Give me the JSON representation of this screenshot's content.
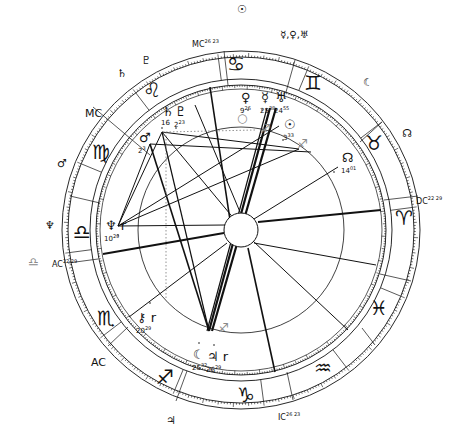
{
  "chart": {
    "center": [
      241,
      230
    ],
    "radii": {
      "outer_out": 179,
      "outer_in": 173,
      "zodiac_out": 151,
      "zodiac_in": 145,
      "house_ring": 141,
      "aspect": 103,
      "hub": 17
    },
    "asc_longitude": 202.5,
    "colors": {
      "ink": "#111111",
      "gray": "#9a9a9a",
      "background": "#ffffff"
    }
  },
  "zodiac_signs": [
    {
      "name": "aries",
      "glyph": "♈",
      "x": 404,
      "y": 218
    },
    {
      "name": "taurus",
      "glyph": "♉",
      "x": 374,
      "y": 143
    },
    {
      "name": "gemini",
      "glyph": "♊",
      "x": 313,
      "y": 83
    },
    {
      "name": "cancer",
      "glyph": "♋",
      "x": 236,
      "y": 64
    },
    {
      "name": "leo",
      "glyph": "♌",
      "x": 152,
      "y": 90
    },
    {
      "name": "virgo",
      "glyph": "♍",
      "x": 101,
      "y": 152
    },
    {
      "name": "libra",
      "glyph": "♎",
      "x": 82,
      "y": 232
    },
    {
      "name": "scorpio",
      "glyph": "♏",
      "x": 106,
      "y": 318
    },
    {
      "name": "sagittarius",
      "glyph": "♐",
      "x": 165,
      "y": 377
    },
    {
      "name": "capricorn",
      "glyph": "♑",
      "x": 246,
      "y": 395
    },
    {
      "name": "aquarius",
      "glyph": "♒",
      "x": 323,
      "y": 368
    },
    {
      "name": "pisces",
      "glyph": "♓",
      "x": 379,
      "y": 308
    }
  ],
  "axes": {
    "mc": {
      "label": "MC",
      "degree": "26",
      "minute": "23",
      "x": 192,
      "y": 39
    },
    "ic": {
      "label": "IC",
      "degree": "26",
      "minute": "23",
      "x": 278,
      "y": 412
    },
    "asc": {
      "label": "AC",
      "degree": "22",
      "minute": "29",
      "x": 52,
      "y": 259
    },
    "dsc": {
      "label": "DC",
      "degree": "22",
      "minute": "29",
      "x": 416,
      "y": 196
    }
  },
  "natal_planets": [
    {
      "name": "sun",
      "glyph": "☉",
      "degree": "3",
      "minute": "33",
      "x": 289,
      "y": 125,
      "dx": 283,
      "dy": 140
    },
    {
      "name": "moon",
      "glyph": "☾",
      "degree": "25",
      "minute": "32",
      "x": 198,
      "y": 355,
      "dx": 199,
      "dy": 343
    },
    {
      "name": "mercury",
      "glyph": "☿",
      "degree": "25",
      "minute": "38",
      "x": 266,
      "y": 98,
      "dx": 262,
      "dy": 110
    },
    {
      "name": "venus",
      "glyph": "♀",
      "degree": "9",
      "minute": "26",
      "x": 246,
      "y": 98,
      "dx": 248,
      "dy": 110
    },
    {
      "name": "mars",
      "glyph": "♂",
      "degree": "2",
      "minute": "3",
      "x": 144,
      "y": 138,
      "dx": 152,
      "dy": 150
    },
    {
      "name": "jupiter",
      "glyph": "♃ r",
      "degree": "26",
      "minute": "29",
      "x": 212,
      "y": 357,
      "dx": 214,
      "dy": 345
    },
    {
      "name": "saturn",
      "glyph": "♄",
      "degree": "16",
      "minute": "",
      "x": 167,
      "y": 112,
      "dx": 162,
      "dy": 128
    },
    {
      "name": "uranus",
      "glyph": "♅",
      "degree": "24",
      "minute": "55",
      "x": 280,
      "y": 98,
      "dx": 275,
      "dy": 110
    },
    {
      "name": "neptune",
      "glyph": "♆ r",
      "degree": "10",
      "minute": "29",
      "x": 110,
      "y": 226,
      "dx": 118,
      "dy": 235
    },
    {
      "name": "pluto",
      "glyph": "♇",
      "degree": "2",
      "minute": "23",
      "x": 180,
      "y": 112,
      "dx": 176,
      "dy": 128
    },
    {
      "name": "chiron",
      "glyph": "⚷ r",
      "degree": "20",
      "minute": "29",
      "x": 142,
      "y": 318,
      "dx": 150,
      "dy": 303
    },
    {
      "name": "north-node",
      "glyph": "☊",
      "degree": "14",
      "minute": "01",
      "x": 347,
      "y": 158,
      "dx": 334,
      "dy": 172
    }
  ],
  "transit_planets": [
    {
      "name": "sun",
      "glyph": "☉",
      "x": 237,
      "y": 4
    },
    {
      "name": "mercury-venus-uranus",
      "glyph": "☿,♀,♅",
      "x": 280,
      "y": 30
    },
    {
      "name": "moon",
      "glyph": "☾",
      "x": 363,
      "y": 77
    },
    {
      "name": "north-node",
      "glyph": "☊",
      "x": 402,
      "y": 128
    },
    {
      "name": "saturn",
      "glyph": "♄",
      "x": 117,
      "y": 68
    },
    {
      "name": "pluto",
      "glyph": "♇",
      "x": 141,
      "y": 55
    },
    {
      "name": "mc-marker",
      "glyph": "MC",
      "x": 85,
      "y": 108
    },
    {
      "name": "mars",
      "glyph": "♂",
      "x": 57,
      "y": 158
    },
    {
      "name": "neptune",
      "glyph": "♆",
      "x": 45,
      "y": 220
    },
    {
      "name": "ac-marker",
      "glyph": "AC",
      "x": 91,
      "y": 357
    },
    {
      "name": "jupiter",
      "glyph": "♃",
      "x": 166,
      "y": 415
    }
  ],
  "gray_marks": [
    {
      "name": "libra-gray",
      "glyph": "♎",
      "x": 28,
      "y": 256
    },
    {
      "name": "sagittarius-gray",
      "glyph": "♐",
      "x": 218,
      "y": 322
    },
    {
      "name": "sagittarius-gray-2",
      "glyph": "♐",
      "x": 260,
      "y": 123
    },
    {
      "name": "sagittarius-gray-3",
      "glyph": "♐",
      "x": 297,
      "y": 138
    },
    {
      "name": "circle-gray",
      "glyph": "○",
      "x": 237,
      "y": 112
    }
  ],
  "house_cusps": [
    {
      "x1": 150,
      "y1": 155,
      "x2": 93,
      "y2": 107
    },
    {
      "x1": 228,
      "y1": 85,
      "x2": 224,
      "y2": 51
    },
    {
      "x1": 286,
      "y1": 92,
      "x2": 295,
      "y2": 60
    },
    {
      "x1": 360,
      "y1": 142,
      "x2": 382,
      "y2": 122
    },
    {
      "x1": 384,
      "y1": 200,
      "x2": 418,
      "y2": 196
    },
    {
      "x1": 380,
      "y1": 274,
      "x2": 411,
      "y2": 281
    },
    {
      "x1": 362,
      "y1": 328,
      "x2": 375,
      "y2": 345
    },
    {
      "x1": 287,
      "y1": 372,
      "x2": 293,
      "y2": 400
    },
    {
      "x1": 187,
      "y1": 371,
      "x2": 176,
      "y2": 401
    },
    {
      "x1": 128,
      "y1": 327,
      "x2": 108,
      "y2": 346
    },
    {
      "x1": 98,
      "y1": 259,
      "x2": 68,
      "y2": 263
    },
    {
      "x1": 100,
      "y1": 203,
      "x2": 70,
      "y2": 196
    }
  ],
  "aspect_lines": [
    {
      "x1": 150,
      "y1": 144,
      "x2": 209,
      "y2": 331,
      "w": 1.6
    },
    {
      "x1": 162,
      "y1": 132,
      "x2": 209,
      "y2": 331,
      "w": 1.2
    },
    {
      "x1": 162,
      "y1": 132,
      "x2": 118,
      "y2": 226,
      "w": 1.0
    },
    {
      "x1": 162,
      "y1": 132,
      "x2": 299,
      "y2": 149,
      "w": 1.0
    },
    {
      "x1": 162,
      "y1": 132,
      "x2": 235,
      "y2": 220,
      "w": 1.0
    },
    {
      "x1": 118,
      "y1": 226,
      "x2": 299,
      "y2": 149,
      "w": 1.0
    },
    {
      "x1": 118,
      "y1": 226,
      "x2": 279,
      "y2": 126,
      "w": 1.0
    },
    {
      "x1": 118,
      "y1": 226,
      "x2": 150,
      "y2": 144,
      "w": 1.0
    },
    {
      "x1": 150,
      "y1": 144,
      "x2": 311,
      "y2": 152,
      "w": 1.0
    },
    {
      "x1": 210,
      "y1": 87,
      "x2": 230,
      "y2": 220,
      "w": 1.6
    },
    {
      "x1": 276,
      "y1": 108,
      "x2": 212,
      "y2": 331,
      "w": 2.2
    },
    {
      "x1": 270,
      "y1": 108,
      "x2": 209,
      "y2": 331,
      "w": 2.2
    },
    {
      "x1": 267,
      "y1": 108,
      "x2": 207,
      "y2": 331,
      "w": 1.2
    },
    {
      "x1": 248,
      "y1": 248,
      "x2": 275,
      "y2": 372,
      "w": 1.6
    },
    {
      "x1": 258,
      "y1": 222,
      "x2": 381,
      "y2": 210,
      "w": 1.8
    },
    {
      "x1": 224,
      "y1": 233,
      "x2": 103,
      "y2": 254,
      "w": 1.8
    },
    {
      "x1": 254,
      "y1": 243,
      "x2": 376,
      "y2": 265,
      "w": 1.0
    },
    {
      "x1": 253,
      "y1": 241,
      "x2": 348,
      "y2": 330,
      "w": 1.0
    },
    {
      "x1": 254,
      "y1": 219,
      "x2": 338,
      "y2": 167,
      "w": 1.0
    },
    {
      "x1": 227,
      "y1": 243,
      "x2": 129,
      "y2": 317,
      "w": 1.0
    },
    {
      "x1": 240,
      "y1": 212,
      "x2": 195,
      "y2": 105,
      "w": 1.0
    },
    {
      "x1": 225,
      "y1": 225,
      "x2": 118,
      "y2": 226,
      "w": 1.0
    }
  ],
  "dotted_lines": [
    {
      "x1": 166,
      "y1": 132,
      "x2": 166,
      "y2": 300
    },
    {
      "x1": 166,
      "y1": 132,
      "x2": 255,
      "y2": 130
    }
  ]
}
